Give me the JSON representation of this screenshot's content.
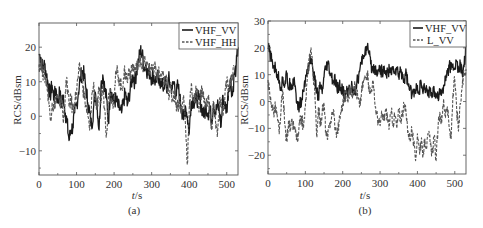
{
  "chart_data": [
    {
      "panel": "(a)",
      "type": "line",
      "title": "",
      "xlabel": "t/s",
      "ylabel": "RCS/dBsm",
      "xlim": [
        0,
        530
      ],
      "ylim": [
        -17,
        27
      ],
      "xticks": [
        0,
        100,
        200,
        300,
        400,
        500
      ],
      "yticks": [
        -10,
        0,
        10,
        20
      ],
      "grid": false,
      "legend_position": "upper right",
      "series": [
        {
          "name": "VHF_VV",
          "style": "solid",
          "x": [
            0,
            5,
            10,
            15,
            20,
            25,
            30,
            35,
            40,
            45,
            50,
            55,
            60,
            65,
            70,
            75,
            80,
            85,
            90,
            95,
            100,
            105,
            110,
            115,
            120,
            125,
            130,
            135,
            140,
            145,
            150,
            155,
            160,
            165,
            170,
            175,
            180,
            185,
            190,
            195,
            200,
            205,
            210,
            215,
            220,
            225,
            230,
            235,
            240,
            245,
            250,
            255,
            260,
            265,
            270,
            275,
            280,
            285,
            290,
            295,
            300,
            305,
            310,
            315,
            320,
            325,
            330,
            335,
            340,
            345,
            350,
            355,
            360,
            365,
            370,
            375,
            380,
            385,
            390,
            395,
            400,
            405,
            410,
            415,
            420,
            425,
            430,
            435,
            440,
            445,
            450,
            455,
            460,
            465,
            470,
            475,
            480,
            485,
            490,
            495,
            500,
            505,
            510,
            515,
            520,
            525,
            530
          ],
          "values": [
            18,
            17,
            14,
            15,
            12,
            9,
            6,
            9,
            5,
            8,
            4,
            7,
            3,
            6,
            1,
            -2,
            -7,
            -4,
            -3,
            1,
            3,
            7,
            11,
            13,
            12,
            8,
            4,
            1,
            -3,
            2,
            7,
            3,
            -4,
            9,
            12,
            8,
            5,
            -2,
            8,
            6,
            4,
            5,
            3,
            2,
            1,
            4,
            7,
            3,
            6,
            9,
            12,
            10,
            13,
            16,
            19,
            18,
            14,
            15,
            12,
            13,
            11,
            12,
            10,
            12,
            9,
            11,
            8,
            10,
            7,
            11,
            9,
            8,
            10,
            6,
            9,
            5,
            2,
            -1,
            3,
            0,
            -5,
            4,
            5,
            4,
            5,
            5,
            4,
            2,
            0,
            3,
            1,
            2,
            -1,
            4,
            1,
            3,
            2,
            -3,
            6,
            3,
            2,
            8,
            11,
            6,
            12,
            14,
            20
          ]
        },
        {
          "name": "VHF_HH",
          "style": "dashed",
          "x": [
            0,
            5,
            10,
            15,
            20,
            25,
            30,
            35,
            40,
            45,
            50,
            55,
            60,
            65,
            70,
            75,
            80,
            85,
            90,
            95,
            100,
            105,
            110,
            115,
            120,
            125,
            130,
            135,
            140,
            145,
            150,
            155,
            160,
            165,
            170,
            175,
            180,
            185,
            190,
            195,
            200,
            205,
            210,
            215,
            220,
            225,
            230,
            235,
            240,
            245,
            250,
            255,
            260,
            265,
            270,
            275,
            280,
            285,
            290,
            295,
            300,
            305,
            310,
            315,
            320,
            325,
            330,
            335,
            340,
            345,
            350,
            355,
            360,
            365,
            370,
            375,
            380,
            385,
            390,
            395,
            400,
            405,
            410,
            415,
            420,
            425,
            430,
            435,
            440,
            445,
            450,
            455,
            460,
            465,
            470,
            475,
            480,
            485,
            490,
            495,
            500,
            505,
            510,
            515,
            520,
            525,
            530
          ],
          "values": [
            15,
            16,
            13,
            12,
            10,
            6,
            -1,
            4,
            2,
            6,
            5,
            3,
            6,
            -2,
            7,
            10,
            3,
            5,
            2,
            4,
            7,
            12,
            14,
            11,
            6,
            3,
            0,
            -4,
            5,
            9,
            6,
            2,
            7,
            4,
            9,
            2,
            -5,
            6,
            8,
            4,
            6,
            12,
            13,
            10,
            8,
            11,
            13,
            10,
            14,
            12,
            15,
            13,
            14,
            15,
            17,
            15,
            16,
            14,
            15,
            13,
            15,
            12,
            14,
            11,
            13,
            10,
            12,
            9,
            10,
            7,
            8,
            5,
            7,
            4,
            3,
            5,
            1,
            6,
            -2,
            -14,
            2,
            8,
            6,
            4,
            8,
            3,
            6,
            8,
            4,
            3,
            6,
            1,
            -4,
            4,
            -1,
            -6,
            2,
            5,
            0,
            6,
            10,
            7,
            9,
            12,
            15
          ]
        }
      ]
    },
    {
      "panel": "(b)",
      "type": "line",
      "title": "",
      "xlabel": "t/s",
      "ylabel": "RCS/dBsm",
      "xlim": [
        0,
        530
      ],
      "ylim": [
        -27,
        30
      ],
      "xticks": [
        0,
        100,
        200,
        300,
        400,
        500
      ],
      "yticks": [
        -20,
        -10,
        0,
        10,
        20,
        30
      ],
      "grid": false,
      "legend_position": "upper right",
      "series": [
        {
          "name": "VHF_VV",
          "style": "solid",
          "x": [
            0,
            5,
            10,
            15,
            20,
            25,
            30,
            35,
            40,
            45,
            50,
            55,
            60,
            65,
            70,
            75,
            80,
            85,
            90,
            95,
            100,
            105,
            110,
            115,
            120,
            125,
            130,
            135,
            140,
            145,
            150,
            155,
            160,
            165,
            170,
            175,
            180,
            185,
            190,
            195,
            200,
            205,
            210,
            215,
            220,
            225,
            230,
            235,
            240,
            245,
            250,
            255,
            260,
            265,
            270,
            275,
            280,
            285,
            290,
            295,
            300,
            305,
            310,
            315,
            320,
            325,
            330,
            335,
            340,
            345,
            350,
            355,
            360,
            365,
            370,
            375,
            380,
            385,
            390,
            395,
            400,
            405,
            410,
            415,
            420,
            425,
            430,
            435,
            440,
            445,
            450,
            455,
            460,
            465,
            470,
            475,
            480,
            485,
            490,
            495,
            500,
            505,
            510,
            515,
            520,
            525,
            530
          ],
          "values": [
            20,
            18,
            15,
            13,
            12,
            10,
            8,
            5,
            9,
            6,
            10,
            5,
            7,
            6,
            9,
            3,
            -3,
            -1,
            0,
            4,
            8,
            12,
            14,
            16,
            12,
            8,
            4,
            2,
            6,
            3,
            9,
            12,
            14,
            11,
            9,
            7,
            8,
            4,
            6,
            5,
            4,
            2,
            3,
            5,
            4,
            6,
            4,
            5,
            8,
            11,
            14,
            17,
            19,
            20,
            18,
            14,
            12,
            13,
            11,
            12,
            12,
            11,
            12,
            10,
            11,
            12,
            10,
            13,
            11,
            12,
            9,
            12,
            10,
            8,
            11,
            6,
            5,
            2,
            4,
            3,
            6,
            4,
            7,
            3,
            5,
            4,
            3,
            5,
            2,
            4,
            3,
            2,
            4,
            3,
            6,
            8,
            11,
            13,
            12,
            14,
            12,
            15,
            11,
            14,
            10,
            13,
            21
          ]
        },
        {
          "name": "L_VV",
          "style": "dashed",
          "x": [
            0,
            5,
            10,
            15,
            20,
            25,
            30,
            35,
            40,
            45,
            50,
            55,
            60,
            65,
            70,
            75,
            80,
            85,
            90,
            95,
            100,
            105,
            110,
            115,
            120,
            125,
            130,
            135,
            140,
            145,
            150,
            155,
            160,
            165,
            170,
            175,
            180,
            185,
            190,
            195,
            200,
            205,
            210,
            215,
            220,
            225,
            230,
            235,
            240,
            245,
            250,
            255,
            260,
            265,
            270,
            275,
            280,
            285,
            290,
            295,
            300,
            305,
            310,
            315,
            320,
            325,
            330,
            335,
            340,
            345,
            350,
            355,
            360,
            365,
            370,
            375,
            380,
            385,
            390,
            395,
            400,
            405,
            410,
            415,
            420,
            425,
            430,
            435,
            440,
            445,
            450,
            455,
            460,
            465,
            470,
            475,
            480,
            485,
            490,
            495,
            500,
            505,
            510,
            515,
            520,
            525,
            530
          ],
          "values": [
            8,
            2,
            -1,
            -4,
            -2,
            -6,
            -12,
            -3,
            4,
            -9,
            -15,
            -7,
            -11,
            -8,
            -10,
            -12,
            -15,
            -8,
            -6,
            -10,
            -2,
            8,
            16,
            20,
            12,
            4,
            -13,
            -2,
            -9,
            -4,
            -1,
            -12,
            -14,
            -8,
            -6,
            -3,
            -10,
            -12,
            -8,
            -4,
            -1,
            2,
            4,
            1,
            5,
            3,
            6,
            4,
            2,
            -2,
            3,
            7,
            9,
            11,
            6,
            3,
            8,
            1,
            -4,
            -7,
            -9,
            -5,
            -7,
            -3,
            -6,
            -9,
            -4,
            -8,
            -5,
            -10,
            -3,
            -7,
            -4,
            -2,
            -5,
            -11,
            -14,
            -10,
            -16,
            -22,
            -12,
            -18,
            -15,
            -20,
            -14,
            -17,
            -12,
            -16,
            -19,
            -13,
            -22,
            -10,
            -4,
            -8,
            1,
            -6,
            -2,
            -10,
            -14,
            3,
            8,
            -3,
            -11,
            -1,
            6,
            10,
            12
          ]
        }
      ]
    }
  ],
  "panels": {
    "a": {
      "caption": "(a)",
      "xlabel_italic": "t",
      "xlabel_rest": "/s",
      "ylabel": "RCS/dBsm",
      "legend": [
        "VHF_VV",
        "VHF_HH"
      ],
      "xtick_labels": [
        "0",
        "100",
        "200",
        "300",
        "400",
        "500"
      ],
      "ytick_labels": [
        "20",
        "10",
        "0",
        "−10"
      ]
    },
    "b": {
      "caption": "(b)",
      "xlabel_italic": "t",
      "xlabel_rest": "/s",
      "ylabel": "RCS/dBsm",
      "legend": [
        "VHF_VV",
        "L_VV"
      ],
      "xtick_labels": [
        "0",
        "100",
        "200",
        "300",
        "400",
        "500"
      ],
      "ytick_labels": [
        "30",
        "20",
        "10",
        "0",
        "−10",
        "−20"
      ]
    }
  },
  "colors": {
    "solid_line": "#1a1a1a",
    "dashed_line": "#555555",
    "axis": "#555555"
  }
}
